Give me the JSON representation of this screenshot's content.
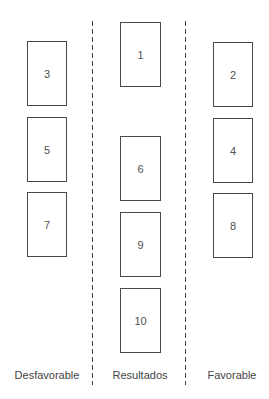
{
  "diagram": {
    "columns": [
      {
        "id": "left",
        "label": "Desfavorable"
      },
      {
        "id": "center",
        "label": "Resultados"
      },
      {
        "id": "right",
        "label": "Favorable"
      }
    ],
    "cards": [
      {
        "number": "1",
        "column": "center",
        "x": 120,
        "y": 22,
        "w": 41,
        "h": 65
      },
      {
        "number": "2",
        "column": "right",
        "x": 213,
        "y": 42,
        "w": 40,
        "h": 65
      },
      {
        "number": "3",
        "column": "left",
        "x": 27,
        "y": 41,
        "w": 40,
        "h": 65
      },
      {
        "number": "4",
        "column": "right",
        "x": 213,
        "y": 118,
        "w": 40,
        "h": 65
      },
      {
        "number": "5",
        "column": "left",
        "x": 27,
        "y": 117,
        "w": 40,
        "h": 65
      },
      {
        "number": "6",
        "column": "center",
        "x": 120,
        "y": 136,
        "w": 41,
        "h": 65
      },
      {
        "number": "7",
        "column": "left",
        "x": 27,
        "y": 192,
        "w": 40,
        "h": 65
      },
      {
        "number": "8",
        "column": "right",
        "x": 213,
        "y": 193,
        "w": 40,
        "h": 65
      },
      {
        "number": "9",
        "column": "center",
        "x": 120,
        "y": 212,
        "w": 41,
        "h": 65
      },
      {
        "number": "10",
        "column": "center",
        "x": 120,
        "y": 288,
        "w": 41,
        "h": 65
      }
    ],
    "dividers": [
      {
        "x": 92
      },
      {
        "x": 185
      }
    ]
  }
}
